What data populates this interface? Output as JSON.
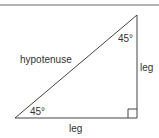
{
  "diagram": {
    "labels": {
      "hypotenuse": "hypotenuse",
      "angle_top": "45°",
      "angle_bottom": "45°",
      "leg_right": "leg",
      "leg_bottom": "leg"
    },
    "colors": {
      "stroke": "#444444",
      "text": "#333333",
      "top_rule": "#888888"
    }
  }
}
